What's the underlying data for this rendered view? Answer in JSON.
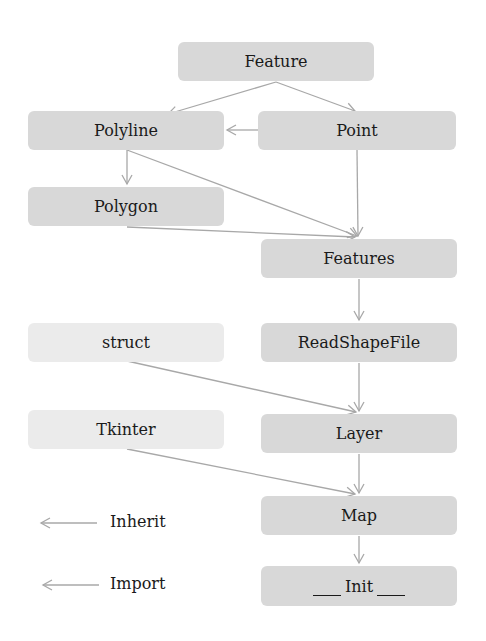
{
  "diagram": {
    "type": "class-dependency-diagram",
    "nodes": [
      {
        "id": "feature",
        "label": "Feature",
        "kind": "class"
      },
      {
        "id": "polyline",
        "label": "Polyline",
        "kind": "class"
      },
      {
        "id": "point",
        "label": "Point",
        "kind": "class"
      },
      {
        "id": "polygon",
        "label": "Polygon",
        "kind": "class"
      },
      {
        "id": "features",
        "label": "Features",
        "kind": "class"
      },
      {
        "id": "struct",
        "label": "struct",
        "kind": "module"
      },
      {
        "id": "readshapefile",
        "label": "ReadShapeFile",
        "kind": "class"
      },
      {
        "id": "tkinter",
        "label": "Tkinter",
        "kind": "module"
      },
      {
        "id": "layer",
        "label": "Layer",
        "kind": "class"
      },
      {
        "id": "map",
        "label": "Map",
        "kind": "class"
      },
      {
        "id": "init",
        "label": "Init",
        "kind": "class"
      }
    ],
    "edges": [
      {
        "from": "feature",
        "to": "polyline"
      },
      {
        "from": "feature",
        "to": "point"
      },
      {
        "from": "point",
        "to": "polyline"
      },
      {
        "from": "polyline",
        "to": "polygon"
      },
      {
        "from": "polyline",
        "to": "features"
      },
      {
        "from": "point",
        "to": "features"
      },
      {
        "from": "polygon",
        "to": "features"
      },
      {
        "from": "features",
        "to": "readshapefile"
      },
      {
        "from": "readshapefile",
        "to": "layer"
      },
      {
        "from": "struct",
        "to": "layer"
      },
      {
        "from": "layer",
        "to": "map"
      },
      {
        "from": "tkinter",
        "to": "map"
      },
      {
        "from": "map",
        "to": "init"
      }
    ],
    "legend": [
      {
        "label": "Inherit"
      },
      {
        "label": "Import"
      }
    ],
    "colors": {
      "class_box": "#d8d8d8",
      "module_box": "#ebebeb",
      "edge": "#a8a8a8"
    }
  }
}
